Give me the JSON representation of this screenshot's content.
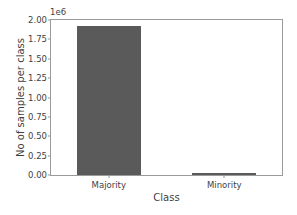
{
  "chart_data": {
    "type": "bar",
    "title": "",
    "xlabel": "Class",
    "ylabel": "No of samples per class",
    "categories": [
      "Majority",
      "Minority"
    ],
    "values": [
      1920000,
      20000
    ],
    "ylim": [
      0,
      2000000
    ],
    "yticks": [
      0,
      250000,
      500000,
      750000,
      1000000,
      1250000,
      1500000,
      1750000,
      2000000
    ],
    "ytick_labels": [
      "0.00",
      "0.25",
      "0.50",
      "0.75",
      "1.00",
      "1.25",
      "1.50",
      "1.75",
      "2.00"
    ],
    "y_offset_text": "1e6",
    "y_scale_factor": 1000000,
    "grid": false,
    "legend": null,
    "bar_color": "#5a5a5a",
    "background_color": "#ffffff",
    "axis_color": "#9a9a9a",
    "text_color": "#3f3f3f"
  }
}
